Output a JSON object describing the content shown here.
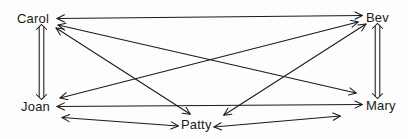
{
  "diagram": {
    "background_color": "#fdfdfd",
    "line_color": "#1a1a1a",
    "nodes": [
      {
        "id": "carol",
        "label": "Carol",
        "x": 40,
        "y": 19
      },
      {
        "id": "bev",
        "label": "Bev",
        "x": 378,
        "y": 18
      },
      {
        "id": "joan",
        "label": "Joan",
        "x": 40,
        "y": 107
      },
      {
        "id": "mary",
        "label": "Mary",
        "x": 378,
        "y": 106
      },
      {
        "id": "patty",
        "label": "Patty",
        "x": 196,
        "y": 125
      }
    ],
    "edges": [
      {
        "id": "carol-bev",
        "from": "carol",
        "to": "bev",
        "style": "double-arrow-thin",
        "path": "top-horizontal"
      },
      {
        "id": "carol-joan",
        "from": "carol",
        "to": "joan",
        "style": "double-arrow-block",
        "path": "left-vertical"
      },
      {
        "id": "bev-mary",
        "from": "bev",
        "to": "mary",
        "style": "double-arrow-block",
        "path": "right-vertical"
      },
      {
        "id": "joan-patty",
        "from": "joan",
        "to": "patty",
        "style": "double-arrow-thin",
        "path": "bottom-left"
      },
      {
        "id": "patty-mary",
        "from": "patty",
        "to": "mary",
        "style": "double-arrow-thin",
        "path": "bottom-right"
      },
      {
        "id": "carol-mary",
        "from": "carol",
        "to": "mary",
        "style": "double-arrow-thin",
        "path": "diagonal"
      },
      {
        "id": "joan-bev",
        "from": "joan",
        "to": "bev",
        "style": "double-arrow-thin",
        "path": "diagonal"
      },
      {
        "id": "carol-patty",
        "from": "carol",
        "to": "patty",
        "style": "double-arrow-thin",
        "path": "diagonal"
      },
      {
        "id": "bev-patty",
        "from": "bev",
        "to": "patty",
        "style": "double-arrow-thin",
        "path": "diagonal"
      },
      {
        "id": "joan-mary",
        "from": "joan",
        "to": "mary",
        "style": "double-arrow-thin",
        "path": "middle-horizontal"
      }
    ],
    "edge_count": 10,
    "node_count": 5
  }
}
